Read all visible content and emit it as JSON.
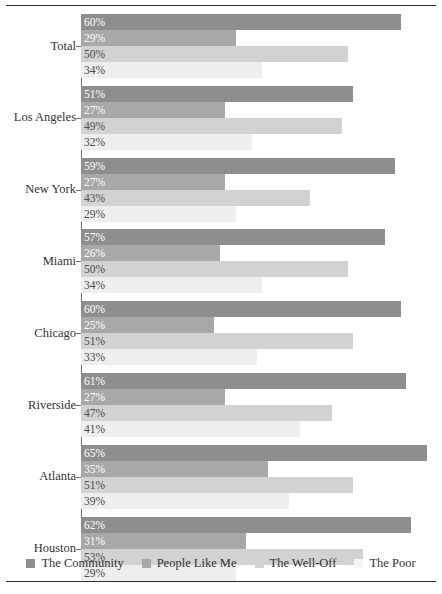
{
  "chart_data": {
    "type": "bar",
    "orientation": "horizontal",
    "title": "",
    "subtitle": "",
    "xlabel": "",
    "ylabel": "",
    "xlim": [
      0,
      68
    ],
    "grid": false,
    "legend_position": "bottom",
    "value_suffix": "%",
    "categories": [
      "Total",
      "Los Angeles",
      "New York",
      "Miami",
      "Chicago",
      "Riverside",
      "Atlanta",
      "Houston"
    ],
    "series": [
      {
        "name": "The Community",
        "color": "#8e8e8e",
        "label_color": "light",
        "values": [
          60,
          51,
          59,
          57,
          60,
          61,
          65,
          62
        ],
        "labels": [
          "60%",
          "51%",
          "59%",
          "57%",
          "60%",
          "61%",
          "65%",
          "62%"
        ]
      },
      {
        "name": "People Like Me",
        "color": "#a8a8a8",
        "label_color": "light",
        "values": [
          29,
          27,
          27,
          26,
          25,
          27,
          35,
          31
        ],
        "labels": [
          "29%",
          "27%",
          "27%",
          "26%",
          "25%",
          "27%",
          "35%",
          "31%"
        ]
      },
      {
        "name": "The Well-Off",
        "color": "#d2d2d2",
        "label_color": "dark",
        "values": [
          50,
          49,
          43,
          50,
          51,
          47,
          51,
          53
        ],
        "labels": [
          "50%",
          "49%",
          "43%",
          "50%",
          "51%",
          "47%",
          "51%",
          "53%"
        ]
      },
      {
        "name": "The Poor",
        "color": "#eeeeee",
        "label_color": "dark",
        "values": [
          34,
          32,
          29,
          34,
          33,
          41,
          39,
          29
        ],
        "labels": [
          "34%",
          "32%",
          "29%",
          "34%",
          "33%",
          "41%",
          "39%",
          "29%"
        ]
      }
    ]
  },
  "legend": {
    "items": [
      {
        "label": "The Community",
        "color": "#8e8e8e"
      },
      {
        "label": "People Like Me",
        "color": "#a8a8a8"
      },
      {
        "label": "The Well-Off",
        "color": "#d2d2d2"
      },
      {
        "label": "The Poor",
        "color": "#f4f4f4"
      }
    ]
  },
  "axis": {
    "origin_x_px": 81,
    "px_per_percent": 5.33
  },
  "rules": {
    "top": true,
    "bottom": true,
    "color": "#2f2f2f"
  }
}
